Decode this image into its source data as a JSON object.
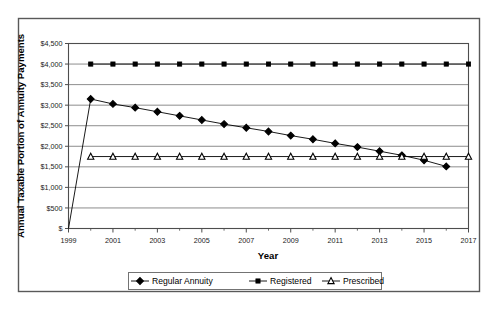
{
  "chart_data": {
    "type": "line",
    "title": "",
    "xlabel": "Year",
    "ylabel": "Annual Taxable Portion of Annuity Payments",
    "x": [
      1999,
      2000,
      2001,
      2002,
      2003,
      2004,
      2005,
      2006,
      2007,
      2008,
      2009,
      2010,
      2011,
      2012,
      2013,
      2014,
      2015,
      2016,
      2017
    ],
    "xlim": [
      1999,
      2017
    ],
    "ylim": [
      0,
      4500
    ],
    "ytick_values": [
      0,
      500,
      1000,
      1500,
      2000,
      2500,
      3000,
      3500,
      4000,
      4500
    ],
    "ytick_labels": [
      "$",
      "$500",
      "$1,000",
      "$1,500",
      "$2,000",
      "$2,500",
      "$3,000",
      "$3,500",
      "$4,000",
      "$4,500"
    ],
    "xtick_values": [
      1999,
      2001,
      2003,
      2005,
      2007,
      2009,
      2011,
      2013,
      2015,
      2017
    ],
    "xtick_labels": [
      "1999",
      "2001",
      "2003",
      "2005",
      "2007",
      "2009",
      "2011",
      "2013",
      "2015",
      "2017"
    ],
    "grid": true,
    "grid_axis": "y",
    "legend_position": "bottom",
    "series": [
      {
        "name": "Regular Annuity",
        "marker": "diamond",
        "color": "#000000",
        "x": [
          1999,
          2000,
          2001,
          2002,
          2003,
          2004,
          2005,
          2006,
          2007,
          2008,
          2009,
          2010,
          2011,
          2012,
          2013,
          2014,
          2015,
          2016
        ],
        "values": [
          0,
          3150,
          3030,
          2940,
          2840,
          2740,
          2640,
          2540,
          2450,
          2360,
          2260,
          2170,
          2070,
          1980,
          1880,
          1780,
          1660,
          1510
        ]
      },
      {
        "name": "Registered",
        "marker": "square",
        "color": "#000000",
        "x": [
          2000,
          2001,
          2002,
          2003,
          2004,
          2005,
          2006,
          2007,
          2008,
          2009,
          2010,
          2011,
          2012,
          2013,
          2014,
          2015,
          2016,
          2017
        ],
        "values": [
          4000,
          4000,
          4000,
          4000,
          4000,
          4000,
          4000,
          4000,
          4000,
          4000,
          4000,
          4000,
          4000,
          4000,
          4000,
          4000,
          4000,
          4000
        ]
      },
      {
        "name": "Prescribed",
        "marker": "triangle",
        "color": "#000000",
        "x": [
          2000,
          2001,
          2002,
          2003,
          2004,
          2005,
          2006,
          2007,
          2008,
          2009,
          2010,
          2011,
          2012,
          2013,
          2014,
          2015,
          2016,
          2017
        ],
        "values": [
          1750,
          1750,
          1750,
          1750,
          1750,
          1750,
          1750,
          1750,
          1750,
          1750,
          1750,
          1750,
          1750,
          1750,
          1750,
          1750,
          1750,
          1750
        ]
      }
    ]
  },
  "legend": {
    "items": [
      {
        "label": "Regular Annuity"
      },
      {
        "label": "Registered"
      },
      {
        "label": "Prescribed"
      }
    ]
  },
  "axes": {
    "x_title": "Year",
    "y_title": "Annual Taxable Portion of Annuity Payments"
  },
  "colors": {
    "ink": "#000000",
    "grid": "#808080",
    "axis": "#4d4d4d",
    "border": "#595959",
    "background": "#ffffff"
  }
}
